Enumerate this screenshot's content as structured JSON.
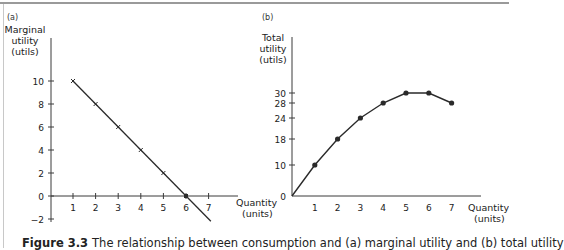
{
  "caption": {
    "label": "Figure 3.3",
    "text": "The relationship between consumption and (a) marginal utility and (b) total utility"
  },
  "colors": {
    "line": "#2a2a2a",
    "axis": "#3a3a3a",
    "border": "#9a9a9a"
  },
  "chart_data": [
    {
      "panel": "(a)",
      "type": "line",
      "title": "",
      "xlabel": "Quantity (units)",
      "ylabel": "Marginal utility (utils)",
      "x": [
        1,
        2,
        3,
        4,
        5,
        6
      ],
      "series": [
        {
          "name": "Marginal utility",
          "values": [
            10,
            8,
            6,
            4,
            2,
            0
          ],
          "marker": "x"
        }
      ],
      "line_extends_to": {
        "x": 7.1,
        "y": -2.2
      },
      "xticks": [
        "1",
        "2",
        "3",
        "4",
        "5",
        "6",
        "7"
      ],
      "yticks": [
        "-2",
        "0",
        "2",
        "4",
        "6",
        "8",
        "10"
      ],
      "xlim": [
        0,
        7.5
      ],
      "ylim": [
        -2,
        12
      ],
      "grid": false,
      "legend": "none"
    },
    {
      "panel": "(b)",
      "type": "line",
      "title": "",
      "xlabel": "Quantity (units)",
      "ylabel": "Total utility (utils)",
      "x": [
        0,
        1,
        2,
        3,
        4,
        5,
        6,
        7
      ],
      "series": [
        {
          "name": "Total utility",
          "values": [
            0,
            10,
            18,
            24,
            28,
            30,
            30,
            28
          ],
          "marker": "dot"
        }
      ],
      "xticks": [
        "1",
        "2",
        "3",
        "4",
        "5",
        "6",
        "7"
      ],
      "yticks": [
        "0",
        "10",
        "18",
        "24",
        "28",
        "30"
      ],
      "xlim": [
        0,
        8.5
      ],
      "ylim": [
        0,
        48
      ],
      "grid": false,
      "legend": "none"
    }
  ],
  "panels": {
    "a": {
      "tag": "(a)",
      "ylabel_lines": [
        "Marginal",
        "utility",
        "(utils)"
      ],
      "xlabel_lines": [
        "Quantity",
        "(units)"
      ]
    },
    "b": {
      "tag": "(b)",
      "ylabel_lines": [
        "Total",
        "utility",
        "(utils)"
      ],
      "xlabel_lines": [
        "Quantity",
        "(units)"
      ]
    }
  }
}
